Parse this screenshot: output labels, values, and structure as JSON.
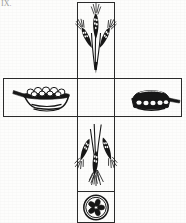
{
  "figure": {
    "caption_fragment": "IX.",
    "layout": "cross",
    "ink_color": "#1a1a1a",
    "frame_color": "#2b2b2b",
    "background_color": "#fdfdfc",
    "panels": [
      {
        "id": "top",
        "position": "top-arm",
        "icon_name": "wheat-sheaf-upright-icon",
        "label": "Wheat sheaf, upright",
        "x": 77,
        "y": 2,
        "width": 38,
        "height": 77
      },
      {
        "id": "left",
        "position": "left-arm",
        "icon_name": "skillet-with-food-icon",
        "label": "Skillet of food with handle",
        "x": 3,
        "y": 78,
        "width": 74,
        "height": 39
      },
      {
        "id": "center",
        "position": "center",
        "icon_name": "empty-panel-icon",
        "label": "Empty center panel",
        "x": 77,
        "y": 78,
        "width": 38,
        "height": 39
      },
      {
        "id": "right",
        "position": "right-arm",
        "icon_name": "covered-dish-icon",
        "label": "Covered dish with handle",
        "x": 115,
        "y": 78,
        "width": 67,
        "height": 39
      },
      {
        "id": "bottom",
        "position": "bottom-arm",
        "icon_name": "wheat-sheaf-inverted-icon",
        "label": "Wheat sheaf, inverted",
        "x": 77,
        "y": 117,
        "width": 38,
        "height": 75
      },
      {
        "id": "foot",
        "position": "bottom-foot",
        "icon_name": "rosette-medallion-icon",
        "label": "Circular rosette medallion",
        "x": 77,
        "y": 192,
        "width": 38,
        "height": 31
      }
    ]
  }
}
